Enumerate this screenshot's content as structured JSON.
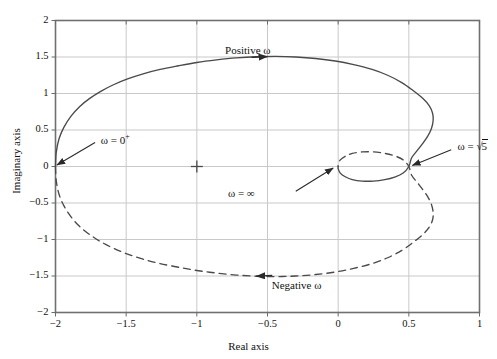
{
  "figure": {
    "background_color": "#ffffff",
    "axis_color": "#5a5a5a",
    "grid_color": "#c8c8c8",
    "curve_color": "#4a4a4a"
  },
  "axes": {
    "xlabel": "Real axis",
    "ylabel": "Imaginary axis",
    "xticks": [
      "-2",
      "-1.5",
      "-1",
      "-0.5",
      "0",
      "0.5",
      "1"
    ],
    "yticks": [
      "2",
      "1.5",
      "1",
      "0.5",
      "0",
      "-0.5",
      "-1",
      "-1.5",
      "-2"
    ],
    "xlim": [
      -2,
      1
    ],
    "ylim": [
      -2,
      2
    ],
    "grid": true
  },
  "annotations": {
    "positive_omega": "Positive ω",
    "negative_omega": "Negative ω",
    "omega_zero_plus_prefix": "ω = 0",
    "omega_zero_plus_sup": "+",
    "omega_infinity": "ω = ∞",
    "omega_sqrt5_prefix": "ω = ",
    "omega_sqrt5_radical": "√",
    "omega_sqrt5_value": "5"
  },
  "chart_data": {
    "type": "line",
    "title": "",
    "xlabel": "Real axis",
    "ylabel": "Imaginary axis",
    "xlim": [
      -2,
      1
    ],
    "ylim": [
      -2,
      2
    ],
    "grid": true,
    "legend": "none",
    "markers": [
      {
        "label": "critical-point-marker",
        "symbol": "+",
        "x": -1,
        "y": 0
      },
      {
        "label": "omega = 0+",
        "x": -2,
        "y": 0
      },
      {
        "label": "omega = sqrt(5)",
        "x": 0.5,
        "y": 0
      },
      {
        "label": "omega = infinity",
        "x": 0,
        "y": 0
      }
    ],
    "series": [
      {
        "name": "Positive ω",
        "style": "solid",
        "points": [
          [
            -2.0,
            0.0
          ],
          [
            -1.995,
            0.19
          ],
          [
            -1.975,
            0.38
          ],
          [
            -1.94,
            0.54
          ],
          [
            -1.89,
            0.69
          ],
          [
            -1.83,
            0.82
          ],
          [
            -1.76,
            0.93
          ],
          [
            -1.68,
            1.03
          ],
          [
            -1.59,
            1.12
          ],
          [
            -1.49,
            1.2
          ],
          [
            -1.38,
            1.27
          ],
          [
            -1.26,
            1.33
          ],
          [
            -1.13,
            1.38
          ],
          [
            -1.0,
            1.425
          ],
          [
            -0.86,
            1.46
          ],
          [
            -0.72,
            1.487
          ],
          [
            -0.58,
            1.503
          ],
          [
            -0.44,
            1.508
          ],
          [
            -0.3,
            1.5
          ],
          [
            -0.16,
            1.48
          ],
          [
            -0.02,
            1.445
          ],
          [
            0.11,
            1.395
          ],
          [
            0.24,
            1.33
          ],
          [
            0.35,
            1.25
          ],
          [
            0.45,
            1.15
          ],
          [
            0.53,
            1.04
          ],
          [
            0.6,
            0.93
          ],
          [
            0.645,
            0.83
          ],
          [
            0.668,
            0.73
          ],
          [
            0.672,
            0.63
          ],
          [
            0.66,
            0.52
          ],
          [
            0.635,
            0.42
          ],
          [
            0.6,
            0.32
          ],
          [
            0.56,
            0.22
          ],
          [
            0.52,
            0.12
          ],
          [
            0.5,
            0.0
          ],
          [
            0.46,
            -0.09
          ],
          [
            0.4,
            -0.145
          ],
          [
            0.33,
            -0.18
          ],
          [
            0.25,
            -0.2
          ],
          [
            0.17,
            -0.2
          ],
          [
            0.1,
            -0.18
          ],
          [
            0.05,
            -0.14
          ],
          [
            0.015,
            -0.09
          ],
          [
            0.0,
            -0.03
          ],
          [
            0.0,
            0.0
          ]
        ]
      },
      {
        "name": "Negative ω",
        "style": "dashed",
        "points": [
          [
            -2.0,
            0.0
          ],
          [
            -1.995,
            -0.19
          ],
          [
            -1.975,
            -0.38
          ],
          [
            -1.94,
            -0.54
          ],
          [
            -1.89,
            -0.69
          ],
          [
            -1.83,
            -0.82
          ],
          [
            -1.76,
            -0.93
          ],
          [
            -1.68,
            -1.03
          ],
          [
            -1.59,
            -1.12
          ],
          [
            -1.49,
            -1.2
          ],
          [
            -1.38,
            -1.27
          ],
          [
            -1.26,
            -1.33
          ],
          [
            -1.13,
            -1.38
          ],
          [
            -1.0,
            -1.425
          ],
          [
            -0.86,
            -1.46
          ],
          [
            -0.72,
            -1.487
          ],
          [
            -0.58,
            -1.503
          ],
          [
            -0.44,
            -1.508
          ],
          [
            -0.3,
            -1.5
          ],
          [
            -0.16,
            -1.48
          ],
          [
            -0.02,
            -1.445
          ],
          [
            0.11,
            -1.395
          ],
          [
            0.24,
            -1.33
          ],
          [
            0.35,
            -1.25
          ],
          [
            0.45,
            -1.15
          ],
          [
            0.53,
            -1.04
          ],
          [
            0.6,
            -0.93
          ],
          [
            0.645,
            -0.83
          ],
          [
            0.668,
            -0.73
          ],
          [
            0.672,
            -0.63
          ],
          [
            0.66,
            -0.52
          ],
          [
            0.635,
            -0.42
          ],
          [
            0.6,
            -0.32
          ],
          [
            0.56,
            -0.22
          ],
          [
            0.52,
            -0.12
          ],
          [
            0.5,
            0.0
          ],
          [
            0.46,
            0.09
          ],
          [
            0.4,
            0.145
          ],
          [
            0.33,
            0.18
          ],
          [
            0.25,
            0.2
          ],
          [
            0.17,
            0.2
          ],
          [
            0.1,
            0.18
          ],
          [
            0.05,
            0.14
          ],
          [
            0.015,
            0.09
          ],
          [
            0.0,
            0.03
          ],
          [
            0.0,
            0.0
          ]
        ]
      }
    ],
    "arrows": [
      {
        "label": "Positive ω",
        "x": -0.5,
        "y": 1.505,
        "direction": "right"
      },
      {
        "label": "Negative ω",
        "x": -0.58,
        "y": -1.503,
        "direction": "left"
      }
    ]
  }
}
